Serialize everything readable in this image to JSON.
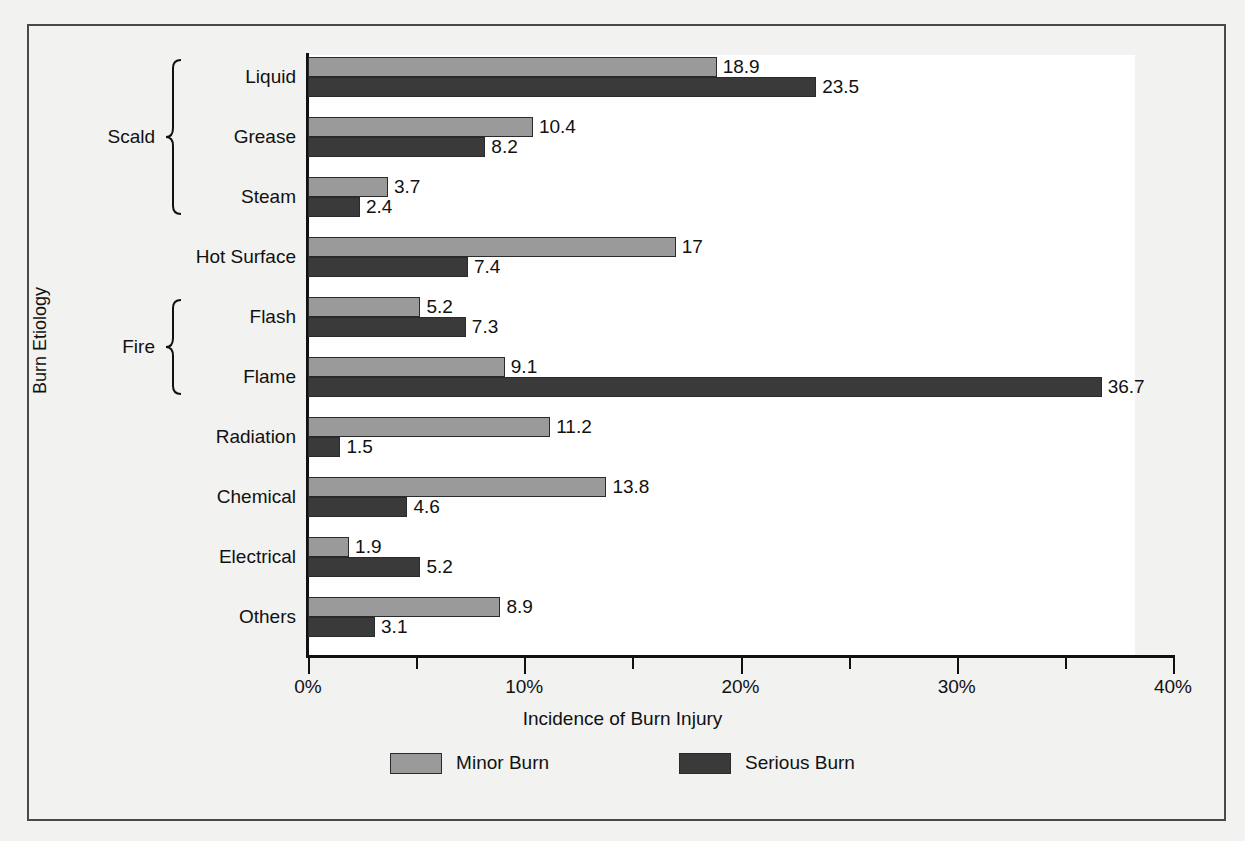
{
  "chart_data": {
    "type": "bar",
    "orientation": "horizontal",
    "title": "",
    "xlabel": "Incidence of Burn Injury",
    "ylabel": "Burn Etiology",
    "xlim": [
      0,
      40
    ],
    "x_tick_labels": [
      "0%",
      "10%",
      "20%",
      "30%",
      "40%"
    ],
    "x_tick_values": [
      0,
      10,
      20,
      30,
      40
    ],
    "x_minor_tick_values": [
      5,
      15,
      25,
      35
    ],
    "grid": false,
    "legend_position": "bottom",
    "categories": [
      "Liquid",
      "Grease",
      "Steam",
      "Hot Surface",
      "Flash",
      "Flame",
      "Radiation",
      "Chemical",
      "Electrical",
      "Others"
    ],
    "groups": [
      {
        "label": "Scald",
        "members": [
          "Liquid",
          "Grease",
          "Steam"
        ]
      },
      {
        "label": "Fire",
        "members": [
          "Flash",
          "Flame"
        ]
      }
    ],
    "series": [
      {
        "name": "Minor Burn",
        "color": "#9a9a9a",
        "values": [
          18.9,
          10.4,
          3.7,
          17,
          5.2,
          9.1,
          11.2,
          13.8,
          1.9,
          8.9
        ],
        "labels": [
          "18.9",
          "10.4",
          "3.7",
          "17",
          "5.2",
          "9.1",
          "11.2",
          "13.8",
          "1.9",
          "8.9"
        ]
      },
      {
        "name": "Serious Burn",
        "color": "#3a3a3a",
        "values": [
          23.5,
          8.2,
          2.4,
          7.4,
          7.3,
          36.7,
          1.5,
          4.6,
          5.2,
          3.1
        ],
        "labels": [
          "23.5",
          "8.2",
          "2.4",
          "7.4",
          "7.3",
          "36.7",
          "1.5",
          "4.6",
          "5.2",
          "3.1"
        ]
      }
    ]
  },
  "legend": {
    "items": [
      {
        "label": "Minor Burn",
        "color": "#9a9a9a"
      },
      {
        "label": "Serious Burn",
        "color": "#3a3a3a"
      }
    ]
  },
  "colors": {
    "minor_burn": "#9a9a9a",
    "serious_burn": "#3a3a3a",
    "axis": "#111111",
    "page_background": "#f2f2f0",
    "plot_background": "#ffffff"
  }
}
